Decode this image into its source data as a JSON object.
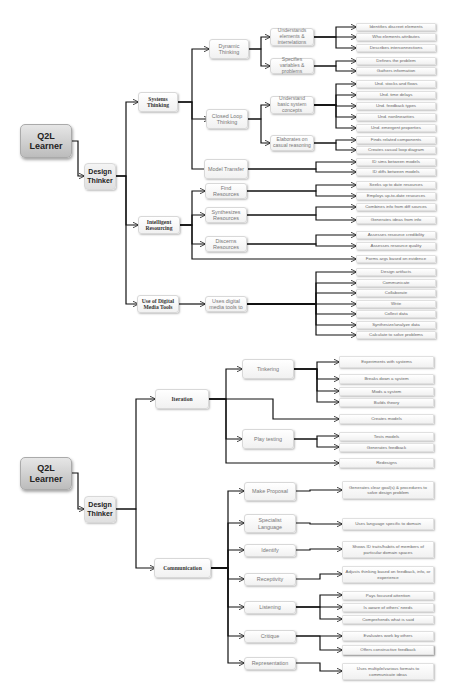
{
  "diagram": {
    "type": "hierarchical-tree",
    "colors": {
      "line": "#111111",
      "root_fill": "#c8c8c8",
      "node_fill": "#f5f5f5",
      "text": "#666666"
    },
    "tree1": {
      "root": "Q2L Learner",
      "child": "Design Thinker",
      "branches": [
        {
          "label": "Systems Thinking",
          "children": [
            {
              "label": "Dynamic Thinking",
              "children": [
                {
                  "label": "Understands elements & interrelations",
                  "leaves": [
                    "Identifies discreet elements",
                    "Who elements attributes",
                    "Describes interconnections"
                  ]
                },
                {
                  "label": "Specifies variables & problems",
                  "leaves": [
                    "Defines the problem",
                    "Gathers information"
                  ]
                }
              ]
            },
            {
              "label": "Closed Loop Thinking",
              "children": [
                {
                  "label": "Understand basic system concepts",
                  "leaves": [
                    "Und. stocks and flows",
                    "Und. time delays",
                    "Und. feedback types",
                    "Und. nonlinearities",
                    "Und. emergent properties"
                  ]
                },
                {
                  "label": "Elaborates on casual reasoning",
                  "leaves": [
                    "Finds related components",
                    "Creates casual loop diagram"
                  ]
                }
              ]
            },
            {
              "label": "Model Transfer",
              "leaves": [
                "ID sims between models",
                "ID diffs between models"
              ]
            }
          ]
        },
        {
          "label": "Intelligent Resourcing",
          "children": [
            {
              "label": "Find Resources",
              "leaves": [
                "Seeks up to date resources",
                "Employs up-to-date resources"
              ]
            },
            {
              "label": "Synthesizes Resources",
              "leaves": [
                "Combines info from diff sources",
                "Generates ideas from info"
              ]
            },
            {
              "label": "Discerns Resources",
              "leaves": [
                "Assesses resource credibility",
                "Assesses resource quality"
              ]
            }
          ],
          "direct_leaves": [
            "Forms args based on evidence"
          ]
        },
        {
          "label": "Use of Digital Media Tools",
          "children": [
            {
              "label": "Uses digital media tools to",
              "leaves": [
                "Design artifacts",
                "Communicate",
                "Collaborate",
                "Write",
                "Collect data",
                "Synthesize/analyze data",
                "Calculate to solve problems"
              ]
            }
          ]
        }
      ]
    },
    "tree2": {
      "root": "Q2L Learner",
      "child": "Design Thinker",
      "branches": [
        {
          "label": "Iteration",
          "children": [
            {
              "label": "Tinkering",
              "leaves": [
                "Experiments with systems",
                "Breaks down a system",
                "Mods a system",
                "Builds theory"
              ]
            },
            {
              "label": "Play testing",
              "leaves": [
                "Tests models",
                "Generates feedback"
              ]
            }
          ],
          "direct_leaves": [
            "Creates models",
            "Redesigns"
          ]
        },
        {
          "label": "Communication",
          "children": [
            {
              "label": "Make Proposal",
              "leaves": [
                "Generates clear goal(s) & procedures to solve design problem"
              ]
            },
            {
              "label": "Specialist Language",
              "leaves": [
                "Uses language specific to domain"
              ]
            },
            {
              "label": "Identify",
              "leaves": [
                "Shows ID traits/habits of members of particular domain spaces"
              ]
            },
            {
              "label": "Receptivity",
              "leaves": [
                "Adjusts thinking based on feedback, info, or experience"
              ]
            },
            {
              "label": "Listening",
              "leaves": [
                "Pays focused attention",
                "Is aware of others' needs",
                "Comprehends what is said"
              ]
            },
            {
              "label": "Critique",
              "leaves": [
                "Evaluates work by others",
                "Offers constructive feedback"
              ]
            },
            {
              "label": "Representation",
              "leaves": [
                "Uses multiple/various formats to communicate ideas"
              ]
            }
          ]
        }
      ]
    }
  }
}
